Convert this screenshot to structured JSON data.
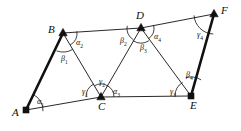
{
  "figure": {
    "type": "geometry-diagram",
    "background_color": "#ffffff",
    "stroke_color": "#111111",
    "thin_stroke_width": 0.9,
    "bold_stroke_width": 2.6,
    "arc_stroke_width": 0.8,
    "width": 241,
    "height": 131
  },
  "vertices": [
    {
      "id": "A",
      "label": "A",
      "x": 26,
      "y": 110,
      "label_x": 12,
      "label_y": 107,
      "marker": "filled-square"
    },
    {
      "id": "B",
      "label": "B",
      "x": 63,
      "y": 33,
      "label_x": 48,
      "label_y": 24,
      "marker": "filled-triangle"
    },
    {
      "id": "C",
      "label": "C",
      "x": 101,
      "y": 97,
      "label_x": 98,
      "label_y": 101,
      "marker": "filled-triangle"
    },
    {
      "id": "D",
      "label": "D",
      "x": 141,
      "y": 28,
      "label_x": 136,
      "label_y": 10,
      "marker": "filled-triangle"
    },
    {
      "id": "E",
      "label": "E",
      "x": 191,
      "y": 96,
      "label_x": 190,
      "label_y": 100,
      "marker": "filled-square"
    },
    {
      "id": "F",
      "label": "F",
      "x": 214,
      "y": 14,
      "label_x": 221,
      "label_y": 5,
      "marker": "filled-triangle"
    }
  ],
  "edges": [
    {
      "id": "AB",
      "from": "A",
      "to": "B",
      "weight": "bold"
    },
    {
      "id": "AC",
      "from": "A",
      "to": "C",
      "weight": "thin"
    },
    {
      "id": "BC",
      "from": "B",
      "to": "C",
      "weight": "thin"
    },
    {
      "id": "BD",
      "from": "B",
      "to": "D",
      "weight": "thin"
    },
    {
      "id": "CD",
      "from": "C",
      "to": "D",
      "weight": "thin"
    },
    {
      "id": "CE",
      "from": "C",
      "to": "E",
      "weight": "thin"
    },
    {
      "id": "DE",
      "from": "D",
      "to": "E",
      "weight": "thin"
    },
    {
      "id": "DF",
      "from": "D",
      "to": "F",
      "weight": "thin"
    },
    {
      "id": "EF",
      "from": "E",
      "to": "F",
      "weight": "bold"
    }
  ],
  "angles": [
    {
      "id": "a1",
      "symbol": "α",
      "sub": "1",
      "vertex": "A",
      "label_x": 37,
      "label_y": 98,
      "arc_r": 17,
      "a_start": -64,
      "a_end": 4
    },
    {
      "id": "a2",
      "symbol": "α",
      "sub": "2",
      "vertex": "B",
      "label_x": 76,
      "label_y": 39,
      "arc_r": 14,
      "a_start": -7,
      "a_end": 60
    },
    {
      "id": "a3",
      "symbol": "α",
      "sub": "3",
      "vertex": "C",
      "label_x": 113,
      "label_y": 88,
      "arc_r": 13,
      "a_start": -62,
      "a_end": 0
    },
    {
      "id": "a4",
      "symbol": "α",
      "sub": "4",
      "vertex": "D",
      "label_x": 154,
      "label_y": 33,
      "arc_r": 13,
      "a_start": -12,
      "a_end": 57
    },
    {
      "id": "b1",
      "symbol": "β",
      "sub": "1",
      "vertex": "B",
      "label_x": 61,
      "label_y": 55,
      "arc_r": 19,
      "a_start": 59,
      "a_end": 110
    },
    {
      "id": "b2",
      "symbol": "β",
      "sub": "2",
      "vertex": "D",
      "label_x": 120,
      "label_y": 37,
      "arc_r": 14,
      "a_start": 123,
      "a_end": 189
    },
    {
      "id": "b3",
      "symbol": "β",
      "sub": "3",
      "vertex": "D",
      "label_x": 140,
      "label_y": 44,
      "arc_r": 15,
      "a_start": 58,
      "a_end": 123
    },
    {
      "id": "b4",
      "symbol": "β",
      "sub": "4",
      "vertex": "E",
      "label_x": 186,
      "label_y": 71,
      "arc_r": 19,
      "a_start": -106,
      "a_end": -58
    },
    {
      "id": "g1",
      "symbol": "γ",
      "sub": "1",
      "vertex": "C",
      "label_x": 82,
      "label_y": 88,
      "arc_r": 15,
      "a_start": 179,
      "a_end": 240
    },
    {
      "id": "g2",
      "symbol": "γ",
      "sub": "2",
      "vertex": "C",
      "label_x": 99,
      "label_y": 78,
      "arc_r": 13,
      "a_start": -121,
      "a_end": -59
    },
    {
      "id": "g3",
      "symbol": "γ",
      "sub": "3",
      "vertex": "E",
      "label_x": 170,
      "label_y": 88,
      "arc_r": 16,
      "a_start": 180,
      "a_end": 238
    },
    {
      "id": "g4",
      "symbol": "γ",
      "sub": "4",
      "vertex": "F",
      "label_x": 197,
      "label_y": 31,
      "arc_r": 20,
      "a_start": 92,
      "a_end": 176
    }
  ]
}
